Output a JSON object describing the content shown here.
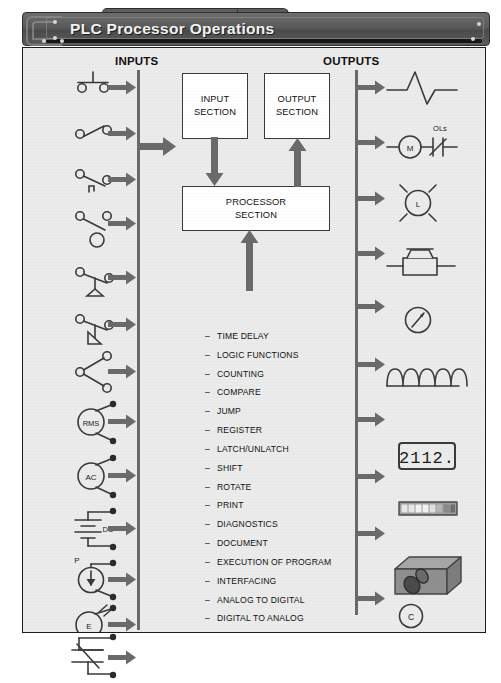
{
  "header": {
    "title": "PLC Processor Operations"
  },
  "columns": {
    "inputs_label": "INPUTS",
    "outputs_label": "OUTPUTS"
  },
  "boxes": {
    "input_section": "INPUT\nSECTION",
    "output_section": "OUTPUT\nSECTION",
    "processor_section": "PROCESSOR\nSECTION"
  },
  "functions": [
    "TIME DELAY",
    "LOGIC FUNCTIONS",
    "COUNTING",
    "COMPARE",
    "JUMP",
    "REGISTER",
    "LATCH/UNLATCH",
    "SHIFT",
    "ROTATE",
    "PRINT",
    "DIAGNOSTICS",
    "DOCUMENT",
    "EXECUTION OF PROGRAM",
    "INTERFACING",
    "ANALOG TO DIGITAL",
    "DIGITAL TO ANALOG"
  ],
  "function_dash": "–",
  "input_devices": [
    {
      "name": "pushbutton-no",
      "label": ""
    },
    {
      "name": "selector-switch",
      "label": ""
    },
    {
      "name": "limit-switch",
      "label": ""
    },
    {
      "name": "float-switch",
      "label": ""
    },
    {
      "name": "pressure-switch",
      "label": ""
    },
    {
      "name": "temperature-switch",
      "label": ""
    },
    {
      "name": "proximity-switch",
      "label": ""
    },
    {
      "name": "rms-sensor",
      "label": "RMS"
    },
    {
      "name": "ac-source",
      "label": "AC"
    },
    {
      "name": "dc-source",
      "label": "DC"
    },
    {
      "name": "pressure-transducer",
      "label": "P"
    },
    {
      "name": "encoder",
      "label": "E"
    },
    {
      "name": "photo-switch",
      "label": ""
    }
  ],
  "output_devices": [
    {
      "name": "heater-element",
      "label": ""
    },
    {
      "name": "motor-starter",
      "label": "M",
      "overload_label": "OLs"
    },
    {
      "name": "pilot-light",
      "label": "L"
    },
    {
      "name": "solenoid-valve",
      "label": ""
    },
    {
      "name": "analog-meter",
      "label": ""
    },
    {
      "name": "coil-winding",
      "label": ""
    },
    {
      "name": "seven-segment-display",
      "label": "2112."
    },
    {
      "name": "bargraph-display",
      "label": ""
    },
    {
      "name": "actuator-block",
      "label": ""
    },
    {
      "name": "control-relay-coil",
      "label": "C"
    }
  ],
  "colors": {
    "header_bg": "#5a5a5a",
    "panel_bg": "#ebebeb",
    "line": "#6a6a6a",
    "ink": "#111111"
  }
}
